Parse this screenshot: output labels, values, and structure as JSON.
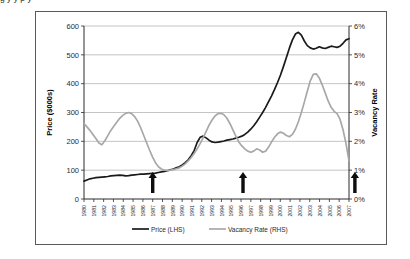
{
  "page": {
    "clipped_top_text": "g          y   y                    p                    y"
  },
  "chart_data": {
    "type": "line",
    "title": "",
    "xlabel": "",
    "ylabel": "Price ($000s)",
    "y2label": "Vacancy Rate",
    "grid": true,
    "legend_position": "bottom",
    "ylim": [
      0,
      600
    ],
    "yticks": [
      0,
      100,
      200,
      300,
      400,
      500,
      600
    ],
    "ytick_labels": [
      "0",
      "100",
      "200",
      "300",
      "400",
      "500",
      "600"
    ],
    "y2lim": [
      0,
      6
    ],
    "y2ticks": [
      0,
      1,
      2,
      3,
      4,
      5,
      6
    ],
    "y2tick_labels": [
      "0%",
      "1%",
      "2%",
      "3%",
      "4%",
      "5%",
      "6%"
    ],
    "categories": [
      "1980",
      "1981",
      "1982",
      "1983",
      "1984",
      "1985",
      "1986",
      "1987",
      "1988",
      "1989",
      "1990",
      "1991",
      "1992",
      "1993",
      "1994",
      "1995",
      "1996",
      "1997",
      "1998",
      "1999",
      "2000",
      "2001",
      "2002",
      "2003",
      "2004",
      "2005",
      "2006",
      "2007"
    ],
    "series": [
      {
        "name": "Price (LHS)",
        "axis": "left",
        "color": "#1a1a1a",
        "legend_label": "Price (LHS)",
        "values": [
          62,
          70,
          74,
          76,
          80,
          82,
          80,
          84,
          86,
          88,
          90,
          94,
          98,
          104,
          112,
          128,
          150,
          215,
          208,
          196,
          200,
          215,
          250,
          300,
          355,
          430,
          520,
          560
        ],
        "values_fine": [
          62,
          66,
          70,
          72,
          74,
          75,
          76,
          77,
          78,
          80,
          81,
          82,
          83,
          82,
          80,
          81,
          83,
          84,
          85,
          86,
          86,
          87,
          88,
          89,
          90,
          92,
          94,
          96,
          98,
          101,
          104,
          108,
          112,
          118,
          126,
          136,
          150,
          168,
          196,
          214,
          218,
          212,
          204,
          198,
          196,
          197,
          199,
          201,
          204,
          206,
          208,
          211,
          214,
          218,
          224,
          232,
          242,
          254,
          268,
          284,
          300,
          318,
          338,
          358,
          380,
          404,
          430,
          460,
          492,
          524,
          552,
          572,
          578,
          568,
          548,
          532,
          524,
          520,
          523,
          528,
          524,
          522,
          526,
          530,
          528,
          526,
          530,
          540,
          552,
          556
        ]
      },
      {
        "name": "Vacancy Rate (RHS)",
        "axis": "right",
        "color": "#a8a8a8",
        "legend_label": "Vacancy Rate (RHS)",
        "values": [
          2.6,
          2.3,
          1.9,
          2.4,
          2.8,
          3.0,
          2.6,
          1.8,
          1.1,
          1.0,
          1.05,
          1.2,
          1.5,
          1.9,
          2.6,
          2.95,
          2.6,
          1.9,
          1.6,
          1.75,
          2.2,
          2.5,
          3.2,
          4.3,
          4.0,
          3.3,
          2.5,
          1.3
        ],
        "values_fine": [
          2.62,
          2.5,
          2.38,
          2.24,
          2.1,
          1.94,
          1.88,
          2.02,
          2.2,
          2.38,
          2.52,
          2.66,
          2.8,
          2.9,
          2.97,
          3.0,
          2.96,
          2.86,
          2.7,
          2.48,
          2.22,
          1.96,
          1.7,
          1.46,
          1.26,
          1.12,
          1.04,
          1.0,
          0.99,
          1.0,
          1.02,
          1.05,
          1.08,
          1.14,
          1.22,
          1.32,
          1.44,
          1.58,
          1.74,
          1.92,
          2.12,
          2.34,
          2.56,
          2.74,
          2.88,
          2.96,
          2.97,
          2.92,
          2.8,
          2.62,
          2.4,
          2.18,
          1.98,
          1.84,
          1.74,
          1.66,
          1.62,
          1.66,
          1.74,
          1.7,
          1.62,
          1.66,
          1.8,
          1.98,
          2.14,
          2.26,
          2.32,
          2.28,
          2.2,
          2.16,
          2.24,
          2.42,
          2.68,
          3.0,
          3.36,
          3.74,
          4.1,
          4.32,
          4.34,
          4.2,
          3.96,
          3.68,
          3.4,
          3.18,
          3.04,
          2.96,
          2.76,
          2.4,
          1.92,
          1.32
        ]
      }
    ],
    "annotations": [
      {
        "name": "arrow-1",
        "label": "",
        "x_year": 1987.0,
        "symbol": "up-arrow"
      },
      {
        "name": "arrow-2",
        "label": "",
        "x_year": 1996.2,
        "symbol": "up-arrow"
      },
      {
        "name": "arrow-3",
        "label": "",
        "x_year": 2007.6,
        "symbol": "up-arrow"
      }
    ]
  }
}
